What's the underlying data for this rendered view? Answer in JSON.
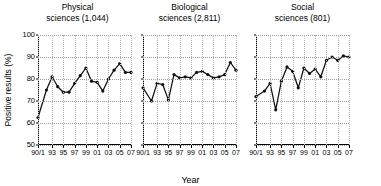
{
  "figure": {
    "xlabel": "Year",
    "ylabel": "Positive results (%)"
  },
  "chart_data": {
    "type": "line",
    "title": "",
    "xlabel": "Year",
    "ylabel": "Positive results (%)",
    "ylim": [
      50,
      100
    ],
    "yticks": [
      50,
      60,
      70,
      80,
      90,
      100
    ],
    "xlim": [
      1990.5,
      2007
    ],
    "xticks": [
      "90/1",
      "93",
      "95",
      "97",
      "99",
      "01",
      "03",
      "05",
      "07"
    ],
    "xtick_values": [
      1990.5,
      1993,
      1995,
      1997,
      1999,
      2001,
      2003,
      2005,
      2007
    ],
    "grid": "dotted-both",
    "legend": "none",
    "marker": "filled-circle",
    "panels": [
      {
        "title": "Physical\nsciences (1,044)",
        "title_line1": "Physical",
        "title_line2": "sciences (1,044)",
        "n": "1,044",
        "x": [
          1990.5,
          1992,
          1993,
          1994,
          1995,
          1996,
          1997,
          1998,
          1999,
          2000,
          2001,
          2002,
          2003,
          2004,
          2005,
          2006,
          2007
        ],
        "values": [
          62.5,
          75.0,
          81.0,
          76.5,
          74.0,
          74.0,
          78.0,
          81.5,
          85.0,
          79.0,
          78.5,
          74.5,
          80.0,
          84.0,
          87.0,
          83.0,
          83.0
        ]
      },
      {
        "title": "Biological\nsciences (2,811)",
        "title_line1": "Biological",
        "title_line2": "sciences (2,811)",
        "n": "2,811",
        "x": [
          1990.5,
          1992,
          1993,
          1994,
          1995,
          1996,
          1997,
          1998,
          1999,
          2000,
          2001,
          2002,
          2003,
          2004,
          2005,
          2006,
          2007
        ],
        "values": [
          76.0,
          70.0,
          78.0,
          77.5,
          70.5,
          82.0,
          80.5,
          81.0,
          80.5,
          83.0,
          83.5,
          82.0,
          80.5,
          81.0,
          82.0,
          87.5,
          84.0
        ]
      },
      {
        "title": "Social\nsciences (801)",
        "title_line1": "Social",
        "title_line2": "sciences (801)",
        "n": "801",
        "x": [
          1990.5,
          1992,
          1993,
          1994,
          1995,
          1996,
          1997,
          1998,
          1999,
          2000,
          2001,
          2002,
          2003,
          2004,
          2005,
          2006,
          2007
        ],
        "values": [
          72.0,
          74.5,
          78.0,
          66.0,
          79.0,
          85.5,
          83.5,
          76.0,
          85.0,
          82.5,
          84.5,
          81.0,
          88.5,
          90.0,
          88.5,
          90.5,
          90.0
        ]
      }
    ]
  }
}
